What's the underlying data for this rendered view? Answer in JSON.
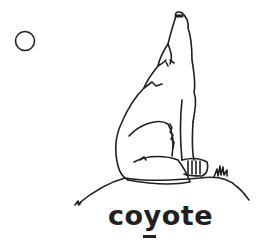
{
  "card": {
    "word": "coyote",
    "underlined_letter": "y",
    "illustration": "howling-coyote-on-hill",
    "moon": "moon-circle-icon"
  },
  "colors": {
    "ink": "#231f20",
    "background": "#ffffff"
  }
}
